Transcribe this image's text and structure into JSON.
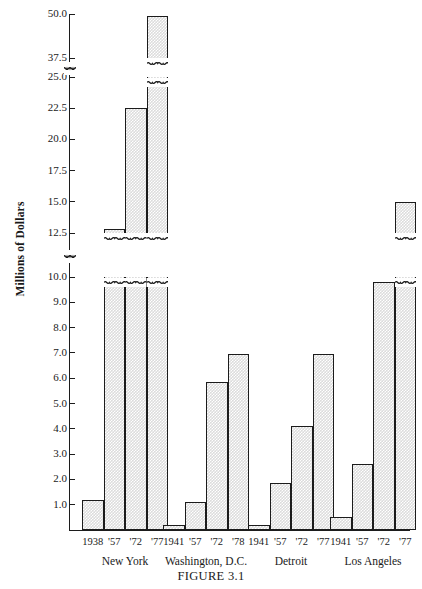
{
  "figure": {
    "caption": "FIGURE 3.1",
    "ylabel": "Millions of Dollars"
  },
  "chart_data": {
    "type": "bar",
    "title": "",
    "subtitle": "",
    "caption": "FIGURE 3.1",
    "xlabel": "",
    "ylabel": "Millions of Dollars",
    "grid": false,
    "legend": null,
    "axis_broken": true,
    "axis_break_note": "Vertical scale is broken twice: between 10.0 and 12.5, and between 25.0 and 37.5. Bars crossing a break are drawn with a squiggle interruption.",
    "ytick_labels": [
      "1.0",
      "2.0",
      "3.0",
      "4.0",
      "5.0",
      "6.0",
      "7.0",
      "8.0",
      "9.0",
      "10.0",
      "12.5",
      "15.0",
      "17.5",
      "20.0",
      "22.5",
      "25.0",
      "37.5",
      "50.0"
    ],
    "ylim": [
      0,
      50.0
    ],
    "groups": [
      {
        "name": "New York",
        "categories": [
          "1938",
          "'57",
          "'72",
          "'77"
        ],
        "values": [
          1.2,
          12.8,
          22.5,
          49.5
        ]
      },
      {
        "name": "Washington, D.C.",
        "categories": [
          "1941",
          "'57",
          "'72",
          "'78"
        ],
        "values": [
          0.2,
          1.1,
          5.85,
          6.95
        ]
      },
      {
        "name": "Detroit",
        "categories": [
          "1941",
          "'57",
          "'72",
          "'77"
        ],
        "values": [
          0.2,
          1.85,
          4.1,
          6.95
        ]
      },
      {
        "name": "Los Angeles",
        "categories": [
          "1941",
          "'57",
          "'72",
          "'77"
        ],
        "values": [
          0.5,
          2.6,
          9.8,
          15.0
        ]
      }
    ],
    "colors": {
      "bar_fill": "#dcdcdc",
      "bar_edge": "#1c1c1c",
      "axis": "#1c1c1c",
      "background": "#ffffff",
      "text": "#1a1a1a"
    }
  }
}
